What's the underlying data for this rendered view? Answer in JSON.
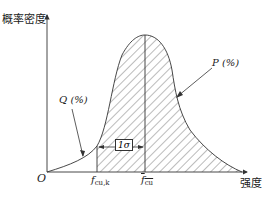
{
  "figure": {
    "y_axis_label": "概率密度",
    "x_axis_label": "强度",
    "origin_label": "O",
    "left_tail_label": "Q (%)",
    "right_area_label": "P (%)",
    "fcuk_symbol": "f",
    "fcuk_subscript": "cu,k",
    "fcu_mean_symbol": "f",
    "fcu_mean_subscript": "cu",
    "sigma_label": "1σ",
    "colors": {
      "line": "#333333",
      "hatch": "#555555",
      "background": "#ffffff"
    }
  }
}
